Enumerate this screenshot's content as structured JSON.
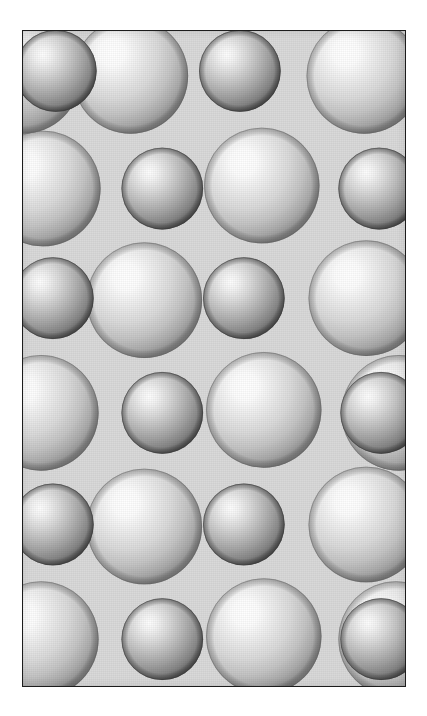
{
  "figure": {
    "kind": "close-packed-sphere-lattice",
    "caption": "",
    "frame": {
      "x": 22,
      "y": 30,
      "width": 384,
      "height": 657,
      "border_color": "#1c1c1c",
      "border_width_px": 1.5
    },
    "page_background": "#ffffff",
    "panel_background": "#d9d9d9"
  },
  "chart_data": {
    "type": "scatter",
    "title": "",
    "subtitle": "",
    "xlabel": "",
    "ylabel": "",
    "grid": false,
    "legend": null,
    "xlim": [
      0,
      384
    ],
    "ylim": [
      0,
      657
    ],
    "annotations": [],
    "atom_types": [
      {
        "name": "large-sphere",
        "radius_px": 58,
        "highlight_color": "#ffffff",
        "mid_color": "#d6d6d6",
        "edge_color": "#8f8f8f",
        "rim_color": "#6e6e6e",
        "count": 14
      },
      {
        "name": "small-sphere",
        "radius_px": 41,
        "highlight_color": "#fbfbfb",
        "mid_color": "#bcbcbc",
        "edge_color": "#7a7a7a",
        "rim_color": "#4a4a4a",
        "count": 13
      }
    ],
    "highlight_offset": {
      "cx_pct": 34,
      "cy_pct": 30
    },
    "rows": [
      {
        "row": 0,
        "y": 42,
        "pattern": [
          "small",
          "large",
          "small",
          "large"
        ]
      },
      {
        "row": 1,
        "y": 155,
        "pattern": [
          "large",
          "small",
          "large",
          "small"
        ]
      },
      {
        "row": 2,
        "y": 268,
        "pattern": [
          "small",
          "large",
          "small",
          "large"
        ]
      },
      {
        "row": 3,
        "y": 381,
        "pattern": [
          "large",
          "small",
          "large",
          "small"
        ]
      },
      {
        "row": 4,
        "y": 494,
        "pattern": [
          "small",
          "large",
          "small",
          "large"
        ]
      },
      {
        "row": 5,
        "y": 607,
        "pattern": [
          "large",
          "small",
          "large",
          "small"
        ]
      }
    ],
    "spheres": [
      {
        "type": "small",
        "x": 33,
        "y": 40,
        "r": 41
      },
      {
        "type": "large",
        "x": 108,
        "y": 45,
        "r": 58
      },
      {
        "type": "small",
        "x": 218,
        "y": 40,
        "r": 41
      },
      {
        "type": "large",
        "x": 343,
        "y": 45,
        "r": 58
      },
      {
        "type": "large",
        "x": 20,
        "y": 158,
        "r": 58
      },
      {
        "type": "small",
        "x": 140,
        "y": 158,
        "r": 41
      },
      {
        "type": "large",
        "x": 240,
        "y": 155,
        "r": 58
      },
      {
        "type": "small",
        "x": 358,
        "y": 158,
        "r": 41
      },
      {
        "type": "small",
        "x": 30,
        "y": 268,
        "r": 41
      },
      {
        "type": "large",
        "x": 122,
        "y": 270,
        "r": 58
      },
      {
        "type": "small",
        "x": 222,
        "y": 268,
        "r": 41
      },
      {
        "type": "large",
        "x": 345,
        "y": 268,
        "r": 58
      },
      {
        "type": "large",
        "x": 18,
        "y": 383,
        "r": 58
      },
      {
        "type": "small",
        "x": 140,
        "y": 383,
        "r": 41
      },
      {
        "type": "large",
        "x": 242,
        "y": 380,
        "r": 58
      },
      {
        "type": "small",
        "x": 360,
        "y": 383,
        "r": 41
      },
      {
        "type": "small",
        "x": 30,
        "y": 495,
        "r": 41
      },
      {
        "type": "large",
        "x": 122,
        "y": 497,
        "r": 58
      },
      {
        "type": "small",
        "x": 222,
        "y": 495,
        "r": 41
      },
      {
        "type": "large",
        "x": 345,
        "y": 495,
        "r": 58
      },
      {
        "type": "large",
        "x": 18,
        "y": 610,
        "r": 58
      },
      {
        "type": "small",
        "x": 140,
        "y": 610,
        "r": 41
      },
      {
        "type": "large",
        "x": 242,
        "y": 607,
        "r": 58
      },
      {
        "type": "small",
        "x": 360,
        "y": 610,
        "r": 41
      },
      {
        "type": "large",
        "x": 375,
        "y": 610,
        "r": 58
      },
      {
        "type": "large",
        "x": 378,
        "y": 383,
        "r": 58
      },
      {
        "type": "large",
        "x": 0,
        "y": 45,
        "r": 58
      }
    ]
  }
}
